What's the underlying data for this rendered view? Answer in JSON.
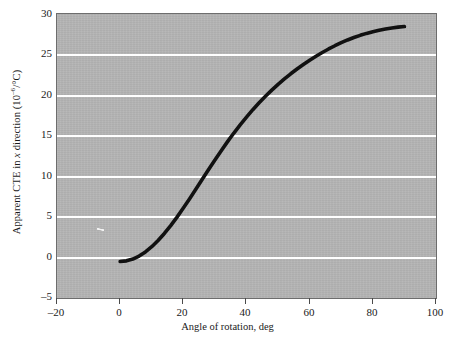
{
  "chart_data": {
    "type": "line",
    "title": "",
    "xlabel": "Angle of rotation, deg",
    "ylabel": "Apparent CTE in x direction (10-6/°C)",
    "ylabel_parts": {
      "prefix": "Apparent CTE in ",
      "italic": "x",
      "middle": " direction (10",
      "superscript": "–6",
      "suffix": "/°C)"
    },
    "xlim": [
      -20,
      100
    ],
    "ylim": [
      -5,
      30
    ],
    "xticks": [
      -20,
      0,
      20,
      40,
      60,
      80,
      100
    ],
    "xticklabels": [
      "–20",
      "0",
      "20",
      "40",
      "60",
      "80",
      "100"
    ],
    "yticks": [
      -5,
      0,
      5,
      10,
      15,
      20,
      25,
      30
    ],
    "yticklabels": [
      "–5",
      "0",
      "5",
      "10",
      "15",
      "20",
      "25",
      "30"
    ],
    "grid": "horizontal",
    "gridlines_y": [
      0,
      5,
      10,
      15,
      20,
      25
    ],
    "legend": null,
    "plot_background": "#b4b4b4",
    "gridline_color": "#ffffff",
    "line_color": "#111111",
    "line_width": 3.6,
    "series": [
      {
        "name": "Apparent CTE",
        "x": [
          0,
          2,
          4,
          6,
          8,
          10,
          12,
          14,
          16,
          18,
          20,
          22,
          24,
          26,
          28,
          30,
          32,
          34,
          36,
          38,
          40,
          42,
          44,
          46,
          48,
          50,
          52,
          54,
          56,
          58,
          60,
          62,
          64,
          66,
          68,
          70,
          72,
          74,
          76,
          78,
          80,
          82,
          84,
          86,
          88,
          90
        ],
        "y": [
          -0.5,
          -0.42,
          -0.2,
          0.17,
          0.68,
          1.32,
          2.08,
          2.95,
          3.92,
          4.97,
          6.08,
          7.24,
          8.43,
          9.63,
          10.83,
          12.01,
          13.16,
          14.27,
          15.33,
          16.34,
          17.3,
          18.21,
          19.06,
          19.86,
          20.62,
          21.33,
          22.0,
          22.63,
          23.22,
          23.78,
          24.31,
          24.8,
          25.26,
          25.69,
          26.09,
          26.46,
          26.8,
          27.1,
          27.37,
          27.61,
          27.82,
          28.0,
          28.15,
          28.28,
          28.38,
          28.45
        ]
      }
    ]
  }
}
